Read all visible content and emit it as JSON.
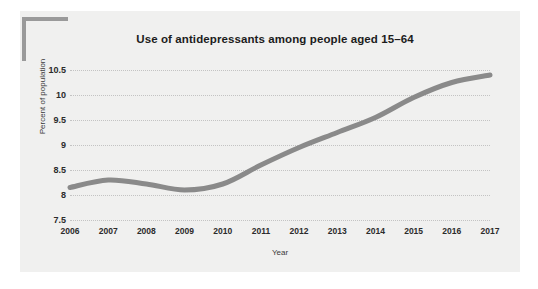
{
  "figure": {
    "background_color": "#ffffff",
    "panel_color": "#f0f0ef",
    "corner_bracket_color": "#9a9a9a"
  },
  "chart_data": {
    "type": "line",
    "title": "Use of antidepressants among people aged 15–64",
    "xlabel": "Year",
    "ylabel": "Percent of population",
    "x": [
      2006,
      2007,
      2008,
      2009,
      2010,
      2011,
      2012,
      2013,
      2014,
      2015,
      2016,
      2017
    ],
    "categories": [
      "2006",
      "2007",
      "2008",
      "2009",
      "2010",
      "2011",
      "2012",
      "2013",
      "2014",
      "2015",
      "2016",
      "2017"
    ],
    "values": [
      8.15,
      8.3,
      8.22,
      8.1,
      8.22,
      8.6,
      8.95,
      9.25,
      9.55,
      9.95,
      10.25,
      10.4
    ],
    "series": [
      {
        "name": "Percent of population",
        "color": "#8a8a8a",
        "values": [
          8.15,
          8.3,
          8.22,
          8.1,
          8.22,
          8.6,
          8.95,
          9.25,
          9.55,
          9.95,
          10.25,
          10.4
        ]
      }
    ],
    "ylim": [
      7.5,
      10.5
    ],
    "xlim": [
      2006,
      2017
    ],
    "yticks": [
      7.5,
      8,
      8.5,
      9,
      9.5,
      10,
      10.5
    ],
    "ytick_labels": [
      "7.5",
      "8",
      "8.5",
      "9",
      "9.5",
      "10",
      "10.5"
    ],
    "xticks": [
      2006,
      2007,
      2008,
      2009,
      2010,
      2011,
      2012,
      2013,
      2014,
      2015,
      2016,
      2017
    ],
    "grid": "horizontal-dotted",
    "grid_color": "#c3c3c3",
    "legend": "none",
    "line_color": "#8a8a8a",
    "line_width": 5
  }
}
